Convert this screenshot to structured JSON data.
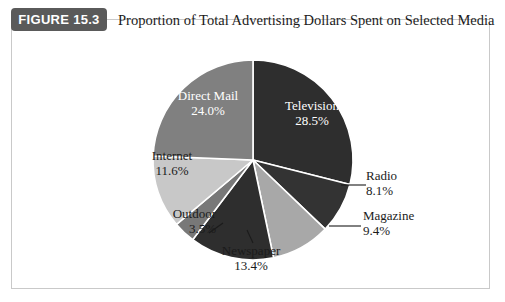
{
  "figure": {
    "badge_label": "FIGURE 15.3",
    "title": "Proportion of Total Advertising Dollars Spent on Selected Media"
  },
  "chart_data": {
    "type": "pie",
    "title": "Proportion of Total Advertising Dollars Spent on Selected Media",
    "xlabel": "",
    "ylabel": "",
    "unit": "percent",
    "start_angle_deg": 0,
    "direction": "clockwise",
    "legend": "none",
    "grid": false,
    "categories": [
      "Television",
      "Radio",
      "Magazine",
      "Newspaper",
      "Outdoor",
      "Internet",
      "Direct Mail"
    ],
    "values": [
      28.5,
      8.1,
      9.4,
      13.4,
      3.5,
      11.6,
      24.0
    ],
    "slice_border_color": "#ffffff",
    "slices": [
      {
        "name": "Television",
        "value": 28.5,
        "value_label": "28.5%",
        "color": "#2e2e2e",
        "label_placement": "inside",
        "label_color": "on-dark"
      },
      {
        "name": "Radio",
        "value": 8.1,
        "value_label": "8.1%",
        "color": "#333333",
        "label_placement": "outside",
        "label_color": "outside",
        "leader_line": true
      },
      {
        "name": "Magazine",
        "value": 9.4,
        "value_label": "9.4%",
        "color": "#a8a8a8",
        "label_placement": "outside",
        "label_color": "outside",
        "leader_line": true
      },
      {
        "name": "Newspaper",
        "value": 13.4,
        "value_label": "13.4%",
        "color": "#2e2e2e",
        "label_placement": "outside",
        "label_color": "outside",
        "leader_line": true
      },
      {
        "name": "Outdoor",
        "value": 3.5,
        "value_label": "3.5%",
        "color": "#787878",
        "label_placement": "outside",
        "label_color": "outside",
        "leader_line": true
      },
      {
        "name": "Internet",
        "value": 11.6,
        "value_label": "11.6%",
        "color": "#c8c8c8",
        "label_placement": "inside",
        "label_color": "on-light"
      },
      {
        "name": "Direct Mail",
        "value": 24.0,
        "value_label": "24.0%",
        "color": "#808080",
        "label_placement": "inside",
        "label_color": "on-mid"
      }
    ]
  }
}
